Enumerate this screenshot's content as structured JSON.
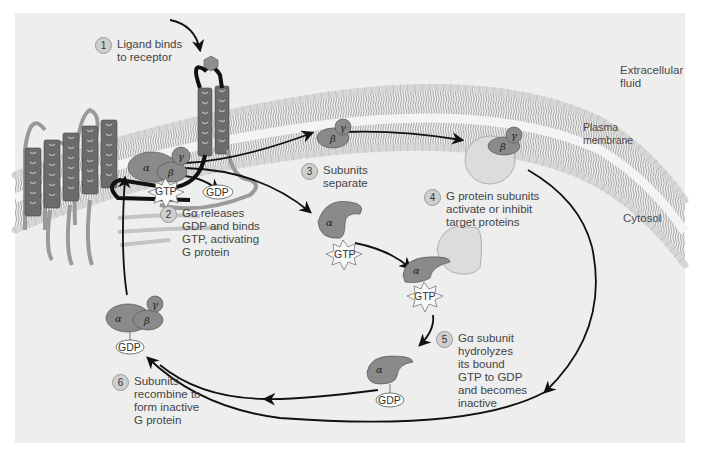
{
  "figure": {
    "regions": {
      "extracellular": "Extracellular\nfluid",
      "membrane": "Plasma\nmembrane",
      "cytosol": "Cytosol"
    },
    "steps": [
      {
        "number": "1",
        "text": "Ligand binds\nto receptor"
      },
      {
        "number": "2",
        "text": "Gα releases\nGDP and binds\nGTP, activating\nG protein"
      },
      {
        "number": "3",
        "text": "Subunits\nseparate"
      },
      {
        "number": "4",
        "text": "G protein subunits\nactivate or inhibit\ntarget proteins"
      },
      {
        "number": "5",
        "text": "Gα subunit\nhydrolyzes\nits bound\nGTP to GDP\nand becomes\ninactive"
      },
      {
        "number": "6",
        "text": "Subunits\nrecombine to\nform inactive\nG protein"
      }
    ],
    "molecules": {
      "gtp": "GTP",
      "gdp": "GDP",
      "alpha": "α",
      "beta": "β",
      "gamma": "γ"
    },
    "colors": {
      "panel": "#eeeeee",
      "protein_dark": "#8a8a8a",
      "protein_light": "#dcdcdc",
      "helix": "#6b6b6b",
      "lipid_head": "#d6d6d6",
      "arrow": "#111111"
    }
  }
}
